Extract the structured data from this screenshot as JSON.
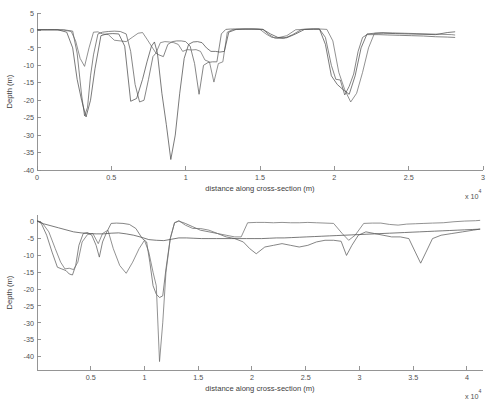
{
  "figure": {
    "background": "#ffffff",
    "line_color_1": "#5a5a5a",
    "line_color_2": "#707070",
    "line_color_3": "#4a4a4a",
    "axis_color": "#8a8a8a"
  },
  "chart_data": [
    {
      "id": "top",
      "type": "line",
      "title": "",
      "xlabel": "distance along cross-section (m)",
      "ylabel": "Depth (m)",
      "x_exponent_label": "x 10",
      "x_exponent_power": "4",
      "x_scale": 10000,
      "xlim": [
        0,
        30000
      ],
      "ylim": [
        -40,
        5
      ],
      "grid": false,
      "legend": "none",
      "xticks": [
        0,
        5000,
        10000,
        15000,
        20000,
        25000,
        30000
      ],
      "xticklabels": [
        "0",
        "0.5",
        "1",
        "1.5",
        "2",
        "2.5",
        "3"
      ],
      "yticks": [
        5,
        0,
        -5,
        -10,
        -15,
        -20,
        -25,
        -30,
        -35,
        -40
      ],
      "yticklabels": [
        "5",
        "0",
        "-5",
        "-10",
        "-15",
        "-20",
        "-25",
        "-30",
        "-35",
        "-40"
      ],
      "series": [
        {
          "name": "profile-1",
          "color": "#5e5e5e",
          "x": [
            0,
            600,
            1200,
            1800,
            2400,
            2700,
            3000,
            3200,
            3400,
            3600,
            3800,
            4100,
            4400,
            4800,
            5200,
            5600,
            6000,
            6300,
            6600,
            6900,
            7200,
            7500,
            7800,
            8000,
            8200,
            8500,
            8800,
            9100,
            9400,
            9700,
            10000,
            10300,
            10600,
            10900,
            11200,
            11500,
            11800,
            12100,
            12400,
            12700,
            13000,
            13600,
            14200,
            14800,
            15200,
            15600,
            16000,
            16600,
            17200,
            17800,
            18400,
            19000,
            19400,
            19800,
            20100,
            20400,
            20700,
            21000,
            21300,
            21600,
            21900,
            22200,
            22600,
            23000,
            23600,
            24400,
            25200,
            26000,
            26800,
            27600,
            28100
          ],
          "y": [
            0.2,
            0.2,
            0.2,
            0.2,
            -0.2,
            -6.5,
            -18.5,
            -24.5,
            -22.0,
            -13.0,
            -7.0,
            -1.0,
            -0.5,
            -0.3,
            -0.2,
            -0.3,
            -1.0,
            -6.0,
            -15.5,
            -20.5,
            -20.0,
            -14.0,
            -7.5,
            -6.5,
            -7.0,
            -7.5,
            -4.0,
            -3.2,
            -3.0,
            -3.0,
            -3.2,
            -4.5,
            -9.5,
            -18.3,
            -10.0,
            -9.2,
            -9.0,
            -9.0,
            -1.0,
            0.3,
            0.4,
            0.4,
            0.4,
            0.4,
            0.3,
            -1.2,
            -2.2,
            -2.3,
            -1.2,
            0.3,
            0.4,
            0.4,
            -2.0,
            -10.0,
            -14.0,
            -14.2,
            -18.5,
            -16.0,
            -12.5,
            -6.0,
            -2.0,
            -1.2,
            -1.2,
            -1.2,
            -1.3,
            -1.4,
            -1.5,
            -1.6,
            -1.8,
            -1.9,
            -2.0
          ]
        },
        {
          "name": "profile-2",
          "color": "#6e6e6e",
          "x": [
            0,
            600,
            1200,
            1800,
            2300,
            2600,
            2900,
            3200,
            3500,
            3800,
            4100,
            4400,
            4800,
            5200,
            5600,
            6000,
            6400,
            6800,
            7100,
            7400,
            7700,
            8000,
            8300,
            8600,
            8900,
            9200,
            9500,
            9800,
            10100,
            10400,
            10700,
            11000,
            11300,
            11600,
            11900,
            12200,
            12500,
            12800,
            13200,
            13800,
            14400,
            15000,
            15400,
            15800,
            16200,
            16800,
            17400,
            18000,
            18600,
            19100,
            19500,
            19900,
            20300,
            20700,
            21100,
            21500,
            21900,
            22300,
            22700,
            23200,
            23900,
            24700,
            25500,
            26300,
            27100,
            27900,
            28100
          ],
          "y": [
            0.2,
            0.2,
            0.2,
            0.1,
            -0.3,
            -3.0,
            -8.0,
            -10.3,
            -5.0,
            -0.5,
            -0.4,
            -1.0,
            -1.2,
            -2.8,
            -3.0,
            -3.2,
            -2.0,
            -0.8,
            -0.6,
            -2.5,
            -4.5,
            -6.5,
            -3.5,
            -3.2,
            -3.3,
            -3.5,
            -4.0,
            -6.0,
            -5.5,
            -5.6,
            -5.5,
            -6.0,
            -8.5,
            -9.0,
            -14.8,
            -9.5,
            -9.0,
            -0.5,
            0.3,
            0.4,
            0.4,
            0.3,
            -1.0,
            -2.0,
            -2.1,
            -1.5,
            0.2,
            0.3,
            0.4,
            0.4,
            0.3,
            -3.0,
            -12.0,
            -17.0,
            -20.5,
            -18.0,
            -12.0,
            -5.0,
            -0.8,
            -0.6,
            -0.7,
            -0.8,
            -0.9,
            -1.0,
            -1.1,
            -1.2,
            -1.3
          ]
        },
        {
          "name": "profile-3",
          "color": "#4d4d4d",
          "x": [
            0,
            700,
            1400,
            2000,
            2400,
            2700,
            3000,
            3300,
            3600,
            3900,
            4300,
            4700,
            5100,
            5500,
            5900,
            6300,
            6700,
            7100,
            7400,
            7700,
            7900,
            8100,
            8400,
            8700,
            9000,
            9300,
            9600,
            9900,
            10200,
            10500,
            10800,
            11100,
            11400,
            11700,
            12000,
            12300,
            12600,
            12900,
            13400,
            14000,
            14600,
            15200,
            15700,
            16200,
            16800,
            17400,
            18000,
            18600,
            19000,
            19400,
            19800,
            20200,
            20600,
            21000,
            21400,
            21800,
            22200,
            22700,
            23300,
            24100,
            25000,
            25900,
            26800,
            27600,
            28100
          ],
          "y": [
            0.2,
            0.2,
            0.2,
            -0.5,
            -5.0,
            -14.0,
            -20.0,
            -24.8,
            -20.0,
            -11.0,
            -1.5,
            -1.0,
            -0.9,
            -1.0,
            -4.5,
            -20.3,
            -19.5,
            -14.0,
            -9.0,
            -4.5,
            -3.3,
            -6.5,
            -18.0,
            -27.0,
            -37.0,
            -30.0,
            -18.0,
            -8.0,
            -4.0,
            -3.3,
            -3.2,
            -3.5,
            -5.0,
            -6.0,
            -6.0,
            -6.2,
            -6.0,
            -0.5,
            0.3,
            0.4,
            0.4,
            0.3,
            -1.0,
            -2.0,
            -2.1,
            -1.0,
            0.3,
            0.4,
            0.4,
            -4.0,
            -13.0,
            -15.5,
            -17.0,
            -18.3,
            -13.0,
            -5.0,
            -1.0,
            -0.8,
            -0.8,
            -0.9,
            -1.0,
            -1.1,
            -1.2,
            -0.6,
            -0.4
          ]
        }
      ]
    },
    {
      "id": "bottom",
      "type": "line",
      "title": "",
      "xlabel": "distance along cross-section (m)",
      "ylabel": "Depth (m)",
      "x_exponent_label": "x 10",
      "x_exponent_power": "4",
      "x_scale": 10000,
      "xlim": [
        0,
        41500
      ],
      "ylim": [
        -44,
        2
      ],
      "grid": false,
      "legend": "none",
      "xticks": [
        5000,
        10000,
        15000,
        20000,
        25000,
        30000,
        35000,
        40000
      ],
      "xticklabels": [
        "0.5",
        "1",
        "1.5",
        "2",
        "2.5",
        "3",
        "3.5",
        "4"
      ],
      "yticks": [
        0,
        -5,
        -10,
        -15,
        -20,
        -25,
        -30,
        -35,
        -40
      ],
      "yticklabels": [
        "0",
        "-5",
        "-10",
        "-15",
        "-20",
        "-25",
        "-30",
        "-35",
        "-40"
      ],
      "series": [
        {
          "name": "profile-1",
          "color": "#5e5e5e",
          "x": [
            0,
            400,
            900,
            1400,
            1900,
            2300,
            2700,
            3000,
            3300,
            3600,
            3900,
            4300,
            4700,
            5100,
            5500,
            5800,
            6100,
            6500,
            6900,
            7400,
            8000,
            8600,
            9200,
            9800,
            10200,
            10500,
            10800,
            11100,
            11400,
            11700,
            12000,
            12400,
            12800,
            13200,
            13800,
            14500,
            15200,
            16000,
            16800,
            17600,
            18400,
            19200,
            19800,
            20400,
            21200,
            22000,
            22800,
            23600,
            24400,
            25200,
            26000,
            26800,
            27600,
            28300,
            28800,
            29300,
            29900,
            30600,
            31400,
            32200,
            33000,
            33800,
            34600,
            35200,
            35700,
            36200,
            36800,
            37600,
            38600,
            39600,
            40600,
            41200
          ],
          "y": [
            0.3,
            -0.5,
            -4.0,
            -9.0,
            -13.5,
            -14.0,
            -14.5,
            -15.5,
            -15.8,
            -13.0,
            -7.0,
            -3.5,
            -3.2,
            -4.0,
            -7.0,
            -10.5,
            -6.0,
            -3.0,
            -0.5,
            -0.4,
            -0.5,
            -0.8,
            -2.0,
            -5.0,
            -6.0,
            -12.0,
            -19.0,
            -21.5,
            -22.5,
            -22.0,
            -14.0,
            -5.0,
            -0.3,
            0.2,
            -0.5,
            -1.5,
            -2.5,
            -3.0,
            -3.5,
            -4.5,
            -5.0,
            -6.0,
            -8.0,
            -9.5,
            -7.5,
            -7.0,
            -6.5,
            -7.0,
            -7.5,
            -7.0,
            -6.0,
            -5.5,
            -5.5,
            -5.8,
            -10.0,
            -7.0,
            -4.0,
            -3.0,
            -3.5,
            -4.0,
            -4.5,
            -4.5,
            -5.0,
            -9.0,
            -12.3,
            -9.0,
            -5.0,
            -4.0,
            -3.5,
            -3.0,
            -2.5,
            -2.2
          ]
        },
        {
          "name": "profile-2",
          "color": "#6e6e6e",
          "x": [
            0,
            500,
            1100,
            1700,
            2200,
            2600,
            3000,
            3400,
            3800,
            4200,
            4700,
            5200,
            5700,
            6100,
            6600,
            7100,
            7700,
            8300,
            8900,
            9500,
            10000,
            10400,
            10800,
            11100,
            11400,
            11700,
            12000,
            12400,
            12800,
            13200,
            13800,
            14500,
            15200,
            16000,
            16800,
            17600,
            18400,
            19000,
            19600,
            20400,
            21200,
            22000,
            22800,
            23600,
            24400,
            25200,
            26000,
            26800,
            27600,
            28400,
            29000,
            29600,
            30400,
            31200,
            32000,
            32800,
            33600,
            34400,
            35200,
            36000,
            36800,
            37800,
            38800,
            39800,
            40800,
            41200
          ],
          "y": [
            0.4,
            -0.4,
            -3.0,
            -8.0,
            -12.0,
            -14.0,
            -13.8,
            -14.2,
            -12.0,
            -6.0,
            -3.8,
            -3.5,
            -6.5,
            -3.5,
            -2.5,
            -8.0,
            -13.0,
            -15.3,
            -12.0,
            -8.0,
            -5.5,
            -9.0,
            -15.0,
            -19.0,
            -41.5,
            -30.0,
            -15.0,
            -5.0,
            -0.3,
            0.3,
            -1.0,
            -2.0,
            -2.0,
            -2.5,
            -3.5,
            -4.0,
            -4.5,
            -4.5,
            -0.3,
            -0.2,
            -0.2,
            -0.3,
            -0.2,
            -0.3,
            -0.3,
            -0.2,
            -0.3,
            -0.4,
            -0.5,
            -3.5,
            -5.5,
            -4.0,
            -0.5,
            -0.4,
            -0.4,
            -0.8,
            -1.0,
            -0.7,
            -0.6,
            -0.5,
            -0.4,
            -0.3,
            0.0,
            0.2,
            0.3,
            0.4
          ]
        },
        {
          "name": "profile-3",
          "color": "#4d4d4d",
          "x": [
            0,
            600,
            1300,
            2000,
            2700,
            3400,
            4100,
            4800,
            5500,
            6200,
            6900,
            7600,
            8300,
            9000,
            9700,
            10400,
            11100,
            11800,
            12500,
            13200,
            13900,
            14600,
            15300,
            16000,
            16700,
            17400,
            18100,
            18800,
            19500,
            20200,
            20900,
            21600,
            22300,
            23000,
            23700,
            24400,
            25100,
            25800,
            26500,
            27200,
            27900,
            28600,
            29300,
            30000,
            30700,
            31400,
            32100,
            32800,
            33500,
            34200,
            34900,
            35600,
            36300,
            37000,
            37700,
            38400,
            39100,
            39800,
            40500,
            41200
          ],
          "y": [
            0.2,
            -0.6,
            -1.2,
            -1.8,
            -2.4,
            -3.0,
            -3.3,
            -3.5,
            -3.6,
            -3.6,
            -3.4,
            -3.3,
            -3.6,
            -4.0,
            -4.6,
            -5.3,
            -5.5,
            -5.6,
            -5.2,
            -4.8,
            -4.8,
            -4.9,
            -5.0,
            -5.0,
            -5.0,
            -5.0,
            -5.0,
            -5.0,
            -5.0,
            -5.0,
            -5.0,
            -4.9,
            -4.8,
            -4.8,
            -4.7,
            -4.6,
            -4.5,
            -4.4,
            -4.3,
            -4.2,
            -4.1,
            -4.0,
            -3.9,
            -3.8,
            -3.7,
            -3.6,
            -3.5,
            -3.4,
            -3.3,
            -3.2,
            -3.1,
            -3.0,
            -2.9,
            -2.8,
            -2.7,
            -2.6,
            -2.5,
            -2.4,
            -2.3,
            -2.2
          ]
        }
      ]
    }
  ]
}
